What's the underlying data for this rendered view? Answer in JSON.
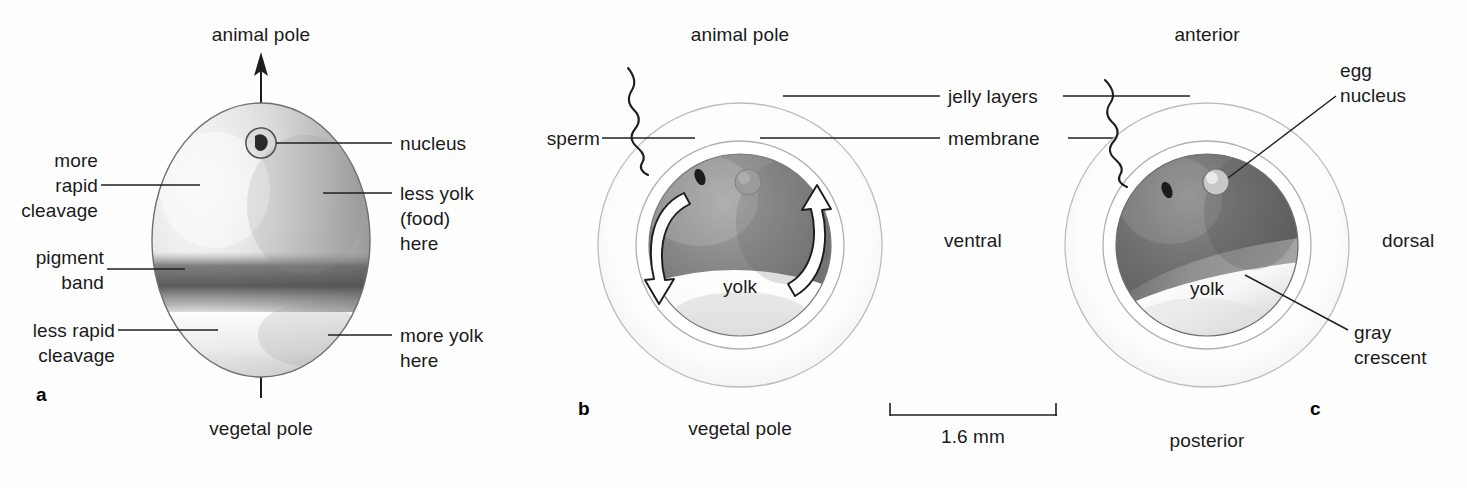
{
  "figure": {
    "type": "biology-diagram",
    "scale_bar": {
      "label": "1.6 mm",
      "x_start": 890,
      "x_end": 1057,
      "y": 413
    }
  },
  "panel_a": {
    "letter": "a",
    "top_label": "animal pole",
    "bottom_label": "vegetal pole",
    "labels": {
      "nucleus": "nucleus",
      "more_rapid_cleavage": "more\nrapid\ncleavage",
      "pigment_band": "pigment\nband",
      "less_rapid_cleavage": "less rapid\ncleavage",
      "less_yolk": "less yolk\n(food)\nhere",
      "more_yolk": "more yolk\nhere"
    },
    "features": {
      "axis": "animal-vegetal axis arrow",
      "pigment_band_present": true,
      "nucleus_position": "animal pole"
    }
  },
  "panel_b": {
    "letter": "b",
    "top_label": "animal pole",
    "bottom_label": "vegetal pole",
    "labels": {
      "sperm": "sperm",
      "jelly_layers": "jelly layers",
      "membrane": "membrane",
      "yolk": "yolk"
    },
    "features": {
      "arrows": "two curved cortical rotation arrows",
      "sperm_entry": "animal hemisphere, upper left"
    }
  },
  "panel_c": {
    "letter": "c",
    "top_label": "anterior",
    "bottom_label": "posterior",
    "left_label": "ventral",
    "right_label": "dorsal",
    "labels": {
      "egg_nucleus": "egg\nnucleus",
      "gray_crescent": "gray\ncrescent",
      "yolk": "yolk"
    },
    "features": {
      "gray_crescent_present": true,
      "gray_crescent_side": "dorsal"
    }
  },
  "colors": {
    "ink": "#1a1a1a",
    "line": "#2b2b2b",
    "jelly_outline": "#b9b9b9",
    "membrane_outline": "#a8a8a8",
    "egg_dark": "#6e6e6e",
    "egg_light": "#f4f4f4",
    "pigment": "#5a5a5a",
    "gray_crescent": "#9a9a9a",
    "page_bg": "#ffffff"
  }
}
